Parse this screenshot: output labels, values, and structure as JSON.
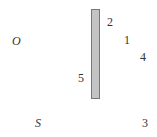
{
  "diagram": {
    "object_label": "O",
    "source_label": "S",
    "barrier": {
      "fill": "#c4c4c4",
      "stroke": "#777777"
    },
    "points": [
      {
        "id": "1",
        "label": "1"
      },
      {
        "id": "2",
        "label": "2"
      },
      {
        "id": "3",
        "label": "3"
      },
      {
        "id": "4",
        "label": "4"
      },
      {
        "id": "5",
        "label": "5"
      }
    ]
  }
}
